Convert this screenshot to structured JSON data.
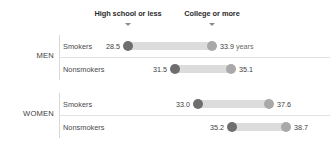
{
  "chart_data": {
    "type": "bar",
    "subtype": "dumbbell",
    "title": "",
    "xlabel": "",
    "ylabel": "",
    "unit": "years",
    "unit_suffix_label": "years",
    "grid": false,
    "legend_position": "top",
    "xlim": [
      27.5,
      39.5
    ],
    "axis_pixel_anchor": {
      "value_low": 28.5,
      "value_high": 33.9
    },
    "series": [
      {
        "name": "High school or less",
        "values": [
          28.5,
          31.5,
          33.0,
          35.2
        ]
      },
      {
        "name": "College or more",
        "values": [
          33.9,
          35.1,
          37.6,
          38.7
        ]
      }
    ],
    "categories": [
      "MEN – Smokers",
      "MEN – Nonsmokers",
      "WOMEN – Smokers",
      "WOMEN – Nonsmokers"
    ],
    "colors": {
      "dot_low": "#6e6e6e",
      "dot_high": "#a9a9a9",
      "track": "#dcdcdc",
      "header_text": "#2b2b2b",
      "marker": "#8a8a8a"
    }
  },
  "headers": [
    {
      "label": "High school or less",
      "center_x": 128
    },
    {
      "label": "College or more",
      "center_x": 212
    }
  ],
  "groups": [
    {
      "label": "MEN",
      "center_y": 55
    },
    {
      "label": "WOMEN",
      "center_y": 113
    }
  ],
  "rows": [
    {
      "label": "Smokers",
      "low_value": "28.5",
      "high_value": "33.9",
      "high_unit": " years",
      "low_x": 128,
      "high_x": 212,
      "top": 35
    },
    {
      "label": "Nonsmokers",
      "low_value": "31.5",
      "high_value": "35.1",
      "high_unit": "",
      "low_x": 175,
      "high_x": 231,
      "top": 58
    },
    {
      "label": "Smokers",
      "low_value": "33.0",
      "high_value": "37.6",
      "high_unit": "",
      "low_x": 198,
      "high_x": 269,
      "top": 93
    },
    {
      "label": "Nonsmokers",
      "low_value": "35.2",
      "high_value": "38.7",
      "high_unit": "",
      "low_x": 232,
      "high_x": 286,
      "top": 116
    }
  ]
}
